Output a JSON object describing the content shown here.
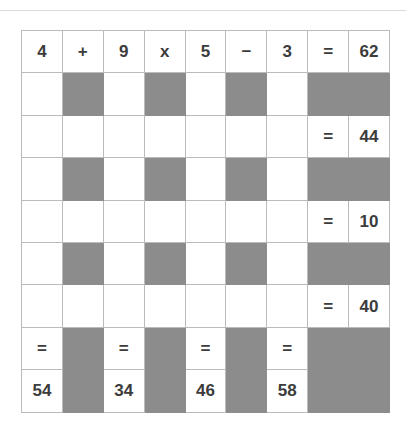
{
  "puzzle": {
    "title": "math-crossword-grid",
    "rows": 9,
    "cols": 9,
    "colors": {
      "shaded": "#8c8c8c",
      "cell_background": "#ffffff",
      "border": "#b9bbbd",
      "text": "#3c3c3c",
      "top_rule": "#d8dadd"
    },
    "grid": [
      [
        {
          "text": "4",
          "state": "filled"
        },
        {
          "text": "+",
          "state": "filled"
        },
        {
          "text": "9",
          "state": "filled"
        },
        {
          "text": "x",
          "state": "filled"
        },
        {
          "text": "5",
          "state": "filled"
        },
        {
          "text": "−",
          "state": "filled"
        },
        {
          "text": "3",
          "state": "filled"
        },
        {
          "text": "=",
          "state": "filled"
        },
        {
          "text": "62",
          "state": "filled"
        }
      ],
      [
        {
          "text": "",
          "state": "blank"
        },
        {
          "text": "",
          "state": "shaded"
        },
        {
          "text": "",
          "state": "blank"
        },
        {
          "text": "",
          "state": "shaded"
        },
        {
          "text": "",
          "state": "blank"
        },
        {
          "text": "",
          "state": "shaded"
        },
        {
          "text": "",
          "state": "blank"
        },
        {
          "text": "",
          "state": "shaded"
        },
        {
          "text": "",
          "state": "shaded"
        }
      ],
      [
        {
          "text": "",
          "state": "blank"
        },
        {
          "text": "",
          "state": "blank"
        },
        {
          "text": "",
          "state": "blank"
        },
        {
          "text": "",
          "state": "blank"
        },
        {
          "text": "",
          "state": "blank"
        },
        {
          "text": "",
          "state": "blank"
        },
        {
          "text": "",
          "state": "blank"
        },
        {
          "text": "=",
          "state": "filled"
        },
        {
          "text": "44",
          "state": "filled"
        }
      ],
      [
        {
          "text": "",
          "state": "blank"
        },
        {
          "text": "",
          "state": "shaded"
        },
        {
          "text": "",
          "state": "blank"
        },
        {
          "text": "",
          "state": "shaded"
        },
        {
          "text": "",
          "state": "blank"
        },
        {
          "text": "",
          "state": "shaded"
        },
        {
          "text": "",
          "state": "blank"
        },
        {
          "text": "",
          "state": "shaded"
        },
        {
          "text": "",
          "state": "shaded"
        }
      ],
      [
        {
          "text": "",
          "state": "blank"
        },
        {
          "text": "",
          "state": "blank"
        },
        {
          "text": "",
          "state": "blank"
        },
        {
          "text": "",
          "state": "blank"
        },
        {
          "text": "",
          "state": "blank"
        },
        {
          "text": "",
          "state": "blank"
        },
        {
          "text": "",
          "state": "blank"
        },
        {
          "text": "=",
          "state": "filled"
        },
        {
          "text": "10",
          "state": "filled"
        }
      ],
      [
        {
          "text": "",
          "state": "blank"
        },
        {
          "text": "",
          "state": "shaded"
        },
        {
          "text": "",
          "state": "blank"
        },
        {
          "text": "",
          "state": "shaded"
        },
        {
          "text": "",
          "state": "blank"
        },
        {
          "text": "",
          "state": "shaded"
        },
        {
          "text": "",
          "state": "blank"
        },
        {
          "text": "",
          "state": "shaded"
        },
        {
          "text": "",
          "state": "shaded"
        }
      ],
      [
        {
          "text": "",
          "state": "blank"
        },
        {
          "text": "",
          "state": "blank"
        },
        {
          "text": "",
          "state": "blank"
        },
        {
          "text": "",
          "state": "blank"
        },
        {
          "text": "",
          "state": "blank"
        },
        {
          "text": "",
          "state": "blank"
        },
        {
          "text": "",
          "state": "blank"
        },
        {
          "text": "=",
          "state": "filled"
        },
        {
          "text": "40",
          "state": "filled"
        }
      ],
      [
        {
          "text": "=",
          "state": "filled"
        },
        {
          "text": "",
          "state": "shaded"
        },
        {
          "text": "=",
          "state": "filled"
        },
        {
          "text": "",
          "state": "shaded"
        },
        {
          "text": "=",
          "state": "filled"
        },
        {
          "text": "",
          "state": "shaded"
        },
        {
          "text": "=",
          "state": "filled"
        },
        {
          "text": "",
          "state": "shaded"
        },
        {
          "text": "",
          "state": "shaded"
        }
      ],
      [
        {
          "text": "54",
          "state": "filled"
        },
        {
          "text": "",
          "state": "shaded"
        },
        {
          "text": "34",
          "state": "filled"
        },
        {
          "text": "",
          "state": "shaded"
        },
        {
          "text": "46",
          "state": "filled"
        },
        {
          "text": "",
          "state": "shaded"
        },
        {
          "text": "58",
          "state": "filled"
        },
        {
          "text": "",
          "state": "shaded"
        },
        {
          "text": "",
          "state": "shaded"
        }
      ]
    ]
  }
}
